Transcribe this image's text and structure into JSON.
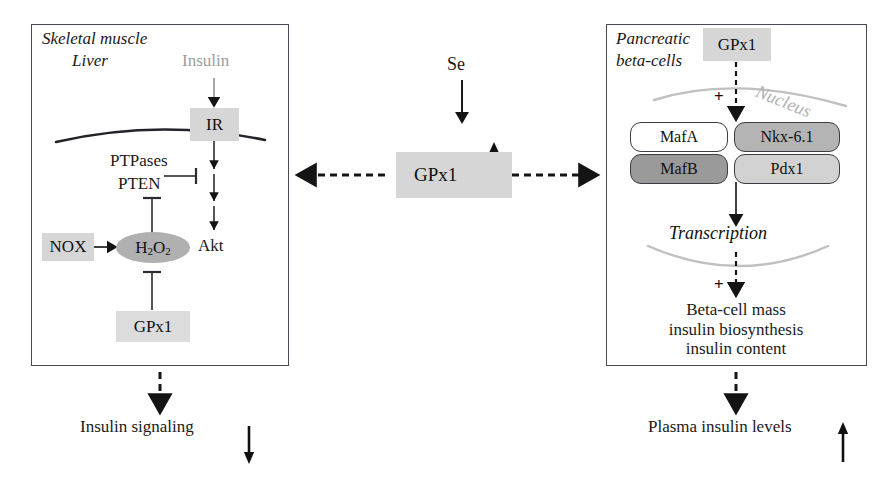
{
  "figure": {
    "background_color": "#ffffff"
  },
  "center": {
    "selenium_label": "Se",
    "gpx1_label": "GPx1",
    "gpx1_trend": "up",
    "arrow_se_to_gpx1": "down-arrow-solid",
    "arrow_to_left_panel": "dashed-arrow-left",
    "arrow_to_right_panel": "dashed-arrow-right"
  },
  "left_panel": {
    "title_line1": "Skeletal muscle",
    "title_line2": "Liver",
    "nodes": {
      "insulin": "Insulin",
      "ir": "IR",
      "ptpases": "PTPases",
      "pten": "PTEN",
      "nox": "NOX",
      "h2o2": "H2O2",
      "h2o2_display": "H",
      "h2o2_sub1": "2",
      "h2o2_mid": "O",
      "h2o2_sub2": "2",
      "akt": "Akt",
      "gpx1": "GPx1"
    },
    "membrane": "plasma-membrane-curve",
    "edges": [
      {
        "from": "Insulin",
        "to": "IR",
        "kind": "activation-arrow"
      },
      {
        "from": "IR",
        "to": "Akt",
        "kind": "activation-arrow-chain"
      },
      {
        "from": "PTPases/PTEN",
        "to": "IR-Akt axis",
        "kind": "inhibition-bar"
      },
      {
        "from": "H2O2",
        "to": "PTPases/PTEN",
        "kind": "inhibition-bar"
      },
      {
        "from": "NOX",
        "to": "H2O2",
        "kind": "activation-arrow"
      },
      {
        "from": "GPx1",
        "to": "H2O2",
        "kind": "inhibition-bar"
      }
    ],
    "outcome": {
      "text": "Insulin signaling",
      "trend": "down",
      "arrow": "dashed-arrow-down"
    }
  },
  "right_panel": {
    "title_line1": "Pancreatic",
    "title_line2": "beta-cells",
    "gpx1_label": "GPx1",
    "nucleus_label": "Nucleus",
    "plus_sign_top": "+",
    "plus_sign_bottom": "+",
    "transcription_factors": [
      {
        "name": "MafA",
        "fill": "white"
      },
      {
        "name": "Nkx-6.1",
        "fill": "mgray"
      },
      {
        "name": "MafB",
        "fill": "dgray"
      },
      {
        "name": "Pdx1",
        "fill": "lgray"
      }
    ],
    "transcription_label": "Transcription",
    "outputs_line1": "Beta-cell mass",
    "outputs_line2": "insulin biosynthesis",
    "outputs_line3": "insulin content",
    "outcome": {
      "text": "Plasma insulin levels",
      "trend": "up",
      "arrow": "dashed-arrow-down"
    }
  },
  "colors": {
    "panel_border": "#4a4a52",
    "box_shade": "#d6d6d6",
    "oval_shade": "#b0b0b0",
    "nucleus_gray": "#b2b2b2",
    "insulin_gray": "#9c9c9c",
    "ink": "#111111"
  }
}
